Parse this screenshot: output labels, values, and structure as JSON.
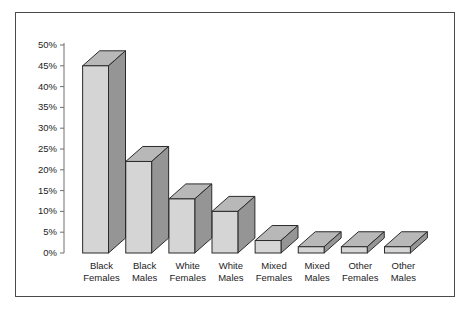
{
  "chart_data": {
    "type": "bar",
    "title": "",
    "subtitle": "",
    "xlabel": "",
    "ylabel": "",
    "categories": [
      "Black Females",
      "Black Males",
      "White Females",
      "White Males",
      "Mixed Females",
      "Mixed Males",
      "Other Females",
      "Other Males"
    ],
    "category_lines": [
      [
        "Black",
        "Females"
      ],
      [
        "Black",
        "Males"
      ],
      [
        "White",
        "Females"
      ],
      [
        "White",
        "Males"
      ],
      [
        "Mixed",
        "Females"
      ],
      [
        "Mixed",
        "Males"
      ],
      [
        "Other",
        "Females"
      ],
      [
        "Other",
        "Males"
      ]
    ],
    "values": [
      45,
      22,
      13,
      10,
      3,
      1.5,
      1.5,
      1.5
    ],
    "ylim": [
      0,
      50
    ],
    "ytick_values": [
      0,
      5,
      10,
      15,
      20,
      25,
      30,
      35,
      40,
      45,
      50
    ],
    "ytick_labels": [
      "0%",
      "5%",
      "10%",
      "15%",
      "20%",
      "25%",
      "30%",
      "35%",
      "40%",
      "45%",
      "50%"
    ],
    "grid": false,
    "legend": false,
    "legend_position": "none",
    "style": "3d-column",
    "colors": {
      "bar_front": "#d5d5d5",
      "bar_side": "#959595",
      "bar_top": "#b8b8b8",
      "bar_outline": "#2b2b2b",
      "axis": "#6e6e6e",
      "text": "#1d1d1d",
      "frame": "#4a4a4a",
      "background": "#ffffff"
    }
  }
}
